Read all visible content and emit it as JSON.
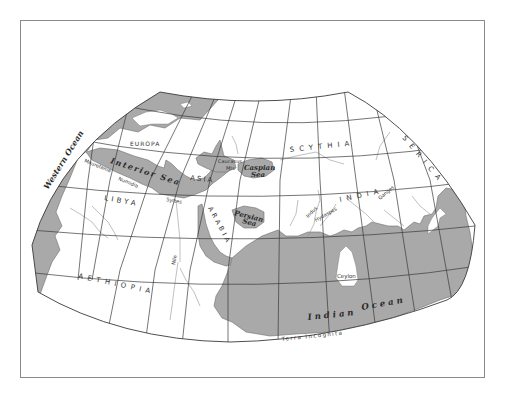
{
  "map": {
    "title": "Ptolemaic world map",
    "colors": {
      "water": "#a9a9a9",
      "land": "#ffffff",
      "grid": "#3a3a3a",
      "frame": "#8a8a8a"
    },
    "labels": {
      "western_ocean": "Western Ocean",
      "europa": "EUROPA",
      "interior_sea": "Interior Sea",
      "mauretania": "Mauretania",
      "numidia": "Numidia",
      "libya": "LIBYA",
      "syrtes": "Syrtes",
      "asia": "ASIA",
      "caucasus": "Caucasus",
      "mts": "Mts",
      "caspian": "Caspian",
      "caspian_sea": "Sea",
      "scythia": "SCYTHIA",
      "serica": "SERICA",
      "persian": "Persian",
      "persian_sea": "Sea",
      "arabia": "ARABIA",
      "india": "INDIA",
      "indus": "Indus",
      "hydaspes": "Hydaspes",
      "ganges": "Ganges",
      "nile": "Nile",
      "aethiopia": "AETHIOPIA",
      "ceylon": "Ceylon",
      "indian_ocean_1": "Indian",
      "indian_ocean_2": "Ocean",
      "terra_incognita": "Terra Incognita"
    }
  }
}
